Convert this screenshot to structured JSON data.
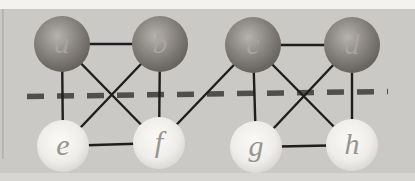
{
  "figure": {
    "type": "graph",
    "canvas": {
      "width": 415,
      "height": 181
    },
    "colors": {
      "panel_bg": "#cac9c6",
      "top_band": "#f3f2ef",
      "bottom_band": "#d7d6d3",
      "left_edge_artifact": "#9b9a97",
      "edge_line": "#1e1e1e",
      "dashed_line": "#514f4c",
      "dark_node_highlight": "#b6b2ad",
      "dark_node_mid": "#8b8782",
      "dark_node_deep": "#6c6863",
      "dark_node_rim": "#575350",
      "light_node_center": "#fbfaf8",
      "light_node_mid": "#eeede9",
      "light_node_rim": "#cbcac7",
      "dark_label": "#a8a49e",
      "light_label": "#97958F"
    },
    "node_radius": {
      "dark": 28,
      "light": 26
    },
    "label_font_size": 30,
    "edge_width": 2.4,
    "nodes": [
      {
        "id": "a",
        "label": "a",
        "x": 62,
        "y": 44,
        "shade": "dark"
      },
      {
        "id": "b",
        "label": "b",
        "x": 160,
        "y": 44,
        "shade": "dark"
      },
      {
        "id": "c",
        "label": "c",
        "x": 253,
        "y": 45,
        "shade": "dark"
      },
      {
        "id": "d",
        "label": "d",
        "x": 352,
        "y": 45,
        "shade": "dark"
      },
      {
        "id": "e",
        "label": "e",
        "x": 63,
        "y": 146,
        "shade": "light"
      },
      {
        "id": "f",
        "label": "f",
        "x": 159,
        "y": 143,
        "shade": "light"
      },
      {
        "id": "g",
        "label": "g",
        "x": 256,
        "y": 147,
        "shade": "light"
      },
      {
        "id": "h",
        "label": "h",
        "x": 352,
        "y": 145,
        "shade": "light"
      }
    ],
    "edges": [
      [
        "a",
        "b"
      ],
      [
        "a",
        "e"
      ],
      [
        "a",
        "f"
      ],
      [
        "b",
        "e"
      ],
      [
        "b",
        "f"
      ],
      [
        "e",
        "f"
      ],
      [
        "c",
        "d"
      ],
      [
        "c",
        "f"
      ],
      [
        "c",
        "g"
      ],
      [
        "c",
        "h"
      ],
      [
        "d",
        "g"
      ],
      [
        "d",
        "h"
      ],
      [
        "g",
        "h"
      ]
    ],
    "dashed_line": {
      "x1": 27,
      "y1": 96.5,
      "x2": 388,
      "y2": 91.5,
      "dash": 17,
      "gap": 13,
      "width": 5.5
    },
    "bands": {
      "top_height": 9,
      "bottom_y": 173,
      "bottom_height": 8
    }
  }
}
